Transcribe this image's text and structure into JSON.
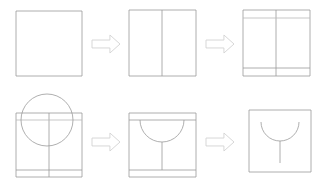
{
  "canvas": {
    "width": 320,
    "height": 187,
    "background": "#ffffff",
    "title": "Square to U-profile construction sequence"
  },
  "style": {
    "line_color": "#9a9a9a",
    "light_line_color": "#b9b9b9",
    "arrow_fill": "#ffffff",
    "arrow_stroke": "#d2d2d2",
    "line_width": 0.8
  },
  "rows": [
    {
      "name": "top-row",
      "steps": [
        {
          "index": 1,
          "name": "step-1-plain-square",
          "description": "Plain square outline",
          "square": {
            "x": 16,
            "y": 11,
            "width": 66,
            "height": 65
          },
          "features": []
        },
        {
          "index": 2,
          "name": "step-2-square-with-center-line",
          "description": "Square with vertical center line",
          "square": {
            "x": 129,
            "y": 10,
            "width": 67,
            "height": 66
          },
          "features": [
            {
              "type": "vertical-line",
              "x": 162,
              "y1": 10,
              "y2": 76
            }
          ]
        },
        {
          "index": 3,
          "name": "step-3-square-with-horizontal-lines",
          "description": "Square with vertical center line and two horizontal offset lines",
          "square": {
            "x": 243,
            "y": 10,
            "width": 67,
            "height": 66
          },
          "features": [
            {
              "type": "vertical-line",
              "x": 276,
              "y1": 10,
              "y2": 76
            },
            {
              "type": "horizontal-line",
              "y": 18,
              "x1": 243,
              "x2": 310
            },
            {
              "type": "horizontal-line",
              "y": 68,
              "x1": 243,
              "x2": 310
            }
          ]
        }
      ]
    },
    {
      "name": "bottom-row",
      "steps": [
        {
          "index": 4,
          "name": "step-4-square-with-circle",
          "description": "Square with construction circle overlapping the top edge",
          "square": {
            "x": 16,
            "y": 113,
            "width": 66,
            "height": 64
          },
          "features": [
            {
              "type": "vertical-line",
              "x": 49,
              "y1": 113,
              "y2": 177
            },
            {
              "type": "horizontal-line",
              "y": 120,
              "x1": 16,
              "x2": 82
            },
            {
              "type": "horizontal-line",
              "y": 170,
              "x1": 16,
              "x2": 82
            },
            {
              "type": "circle",
              "cx": 47,
              "cy": 120,
              "r": 26
            }
          ]
        },
        {
          "index": 5,
          "name": "step-5-semicircle-trimmed",
          "description": "Circle trimmed to lower semicircle with vertical stem",
          "square": {
            "x": 129,
            "y": 113,
            "width": 67,
            "height": 64
          },
          "features": [
            {
              "type": "horizontal-line",
              "y": 120,
              "x1": 129,
              "x2": 196
            },
            {
              "type": "horizontal-line",
              "y": 170,
              "x1": 129,
              "x2": 196
            },
            {
              "type": "semicircle-down",
              "cx": 162,
              "cy": 120,
              "r": 22
            },
            {
              "type": "vertical-line",
              "x": 162,
              "y1": 142,
              "y2": 170
            }
          ]
        },
        {
          "index": 6,
          "name": "step-6-final-u-profile",
          "description": "Final square outline with U arc and stem",
          "square": {
            "x": 249,
            "y": 110,
            "width": 62,
            "height": 62
          },
          "features": [
            {
              "type": "semicircle-down",
              "cx": 280,
              "cy": 122,
              "r": 19
            },
            {
              "type": "vertical-line",
              "x": 280,
              "y1": 141,
              "y2": 163
            }
          ]
        }
      ]
    }
  ],
  "arrows": [
    {
      "name": "arrow-step-1-to-2",
      "x": 92,
      "y": 35,
      "width": 28,
      "height": 18,
      "direction": "right"
    },
    {
      "name": "arrow-step-2-to-3",
      "x": 206,
      "y": 35,
      "width": 28,
      "height": 18,
      "direction": "right"
    },
    {
      "name": "arrow-step-4-to-5",
      "x": 92,
      "y": 133,
      "width": 28,
      "height": 18,
      "direction": "right"
    },
    {
      "name": "arrow-step-5-to-6",
      "x": 206,
      "y": 133,
      "width": 28,
      "height": 18,
      "direction": "right"
    }
  ]
}
